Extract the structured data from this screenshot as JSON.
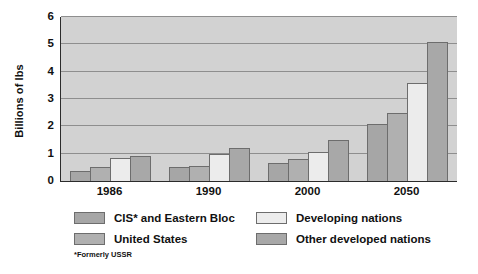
{
  "chart_data": {
    "type": "bar",
    "title": "",
    "subtitle": "",
    "xlabel": "",
    "ylabel": "Billions of lbs",
    "categories": [
      "1986",
      "1990",
      "2000",
      "2050"
    ],
    "ylim": [
      0,
      6
    ],
    "y_ticks": [
      "0",
      "1",
      "2",
      "3",
      "4",
      "5",
      "6"
    ],
    "grid": true,
    "legend_position": "bottom",
    "series": [
      {
        "name": "CIS* and Eastern Bloc",
        "color": "#a6a6a6",
        "values": [
          0.35,
          0.5,
          0.65,
          2.1
        ]
      },
      {
        "name": "United States",
        "color": "#b0b0b0",
        "values": [
          0.5,
          0.55,
          0.8,
          2.5
        ]
      },
      {
        "name": "Developing nations",
        "color": "#ececec",
        "values": [
          0.85,
          1.0,
          1.05,
          3.6
        ]
      },
      {
        "name": "Other developed nations",
        "color": "#a8a8a8",
        "values": [
          0.9,
          1.2,
          1.5,
          5.1
        ]
      }
    ],
    "annotations": [
      "*Formerly USSR"
    ],
    "plot_background": "#d2d2d2"
  },
  "footnote": {
    "text": "*Formerly USSR"
  }
}
